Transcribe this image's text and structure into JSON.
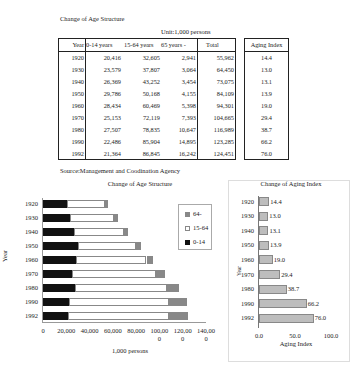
{
  "table": {
    "title": "Change of Age Structure",
    "unit": "Unit:1,000 persons",
    "headers": [
      "Year",
      "0-14 years",
      "15-64 years",
      "65 years -",
      "Total"
    ],
    "rows": [
      [
        "1920",
        "20,416",
        "32,605",
        "2,941",
        "55,962"
      ],
      [
        "1930",
        "23,579",
        "37,807",
        "3,064",
        "64,450"
      ],
      [
        "1940",
        "26,369",
        "43,252",
        "3,454",
        "73,075"
      ],
      [
        "1950",
        "29,786",
        "50,168",
        "4,155",
        "84,109"
      ],
      [
        "1960",
        "28,434",
        "60,469",
        "5,398",
        "94,301"
      ],
      [
        "1970",
        "25,153",
        "72,119",
        "7,393",
        "104,665"
      ],
      [
        "1980",
        "27,507",
        "78,835",
        "10,647",
        "116,989"
      ],
      [
        "1990",
        "22,486",
        "85,904",
        "14,895",
        "123,285"
      ],
      [
        "1992",
        "21,364",
        "86,845",
        "16,242",
        "124,451"
      ]
    ],
    "source": "Source:Management and Coodination Agency"
  },
  "aging_table": {
    "header": "Aging Index",
    "values": [
      "14.4",
      "13.0",
      "13.1",
      "13.9",
      "19.0",
      "29.4",
      "38.7",
      "66.2",
      "76.0"
    ]
  },
  "chart_data": [
    {
      "type": "bar",
      "orientation": "horizontal",
      "stacked": true,
      "title": "Change of Age Structure",
      "xlabel": "1,000 persons",
      "ylabel": "Year",
      "categories": [
        "1920",
        "1930",
        "1940",
        "1950",
        "1960",
        "1970",
        "1980",
        "1990",
        "1992"
      ],
      "series": [
        {
          "name": "0-14",
          "color": "#111111",
          "values": [
            20416,
            23579,
            26369,
            29786,
            28434,
            25153,
            27507,
            22486,
            21364
          ]
        },
        {
          "name": "15-64",
          "color": "#ffffff",
          "values": [
            32605,
            37807,
            43252,
            50168,
            60469,
            72119,
            78835,
            85904,
            86845
          ]
        },
        {
          "name": "64-",
          "color": "#888888",
          "values": [
            2941,
            3064,
            3454,
            4155,
            5398,
            7393,
            10647,
            14895,
            16242
          ]
        }
      ],
      "xlim": [
        0,
        140000
      ],
      "xticks": [
        "0",
        "20,000",
        "40,000",
        "60,000",
        "80,000",
        "100,00\n0",
        "120,00\n0",
        "140,00\n0"
      ],
      "legend_labels": [
        "64-",
        "15-64",
        "0-14"
      ],
      "legend_position": "right"
    },
    {
      "type": "bar",
      "orientation": "horizontal",
      "title": "Change of Aging Index",
      "xlabel": "Aging Index",
      "ylabel": "Year",
      "categories": [
        "1920",
        "1930",
        "1940",
        "1950",
        "1960",
        "1970",
        "1980",
        "1990",
        "1992"
      ],
      "values": [
        14.4,
        13.0,
        13.1,
        13.9,
        19.0,
        29.4,
        38.7,
        66.2,
        76.0
      ],
      "value_labels": [
        "14.4",
        "13.0",
        "13.1",
        "13.9",
        "19.0",
        "29.4",
        "38.7",
        "66.2",
        "76.0"
      ],
      "xlim": [
        0,
        100
      ],
      "xticks": [
        "0.0",
        "50.0",
        "100.0"
      ],
      "color": "#bdbdbd"
    }
  ]
}
